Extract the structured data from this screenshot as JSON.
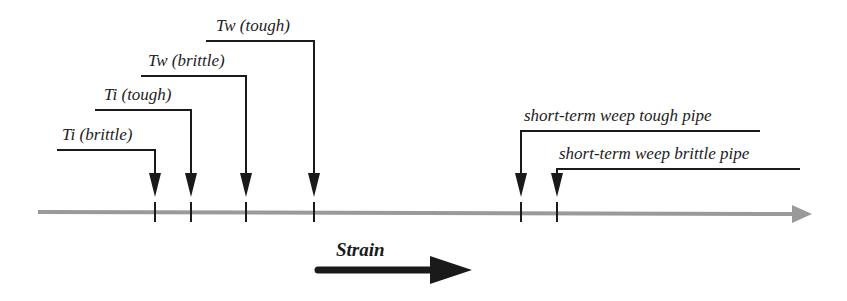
{
  "diagram": {
    "axis": {
      "label": "Strain",
      "color": "#9a9a9a"
    },
    "markers": [
      {
        "id": "ti-brittle",
        "label": "Ti (brittle)",
        "order": 1,
        "side": "left"
      },
      {
        "id": "ti-tough",
        "label": "Ti (tough)",
        "order": 2,
        "side": "left"
      },
      {
        "id": "tw-brittle",
        "label": "Tw (brittle)",
        "order": 3,
        "side": "left"
      },
      {
        "id": "tw-tough",
        "label": "Tw (tough)",
        "order": 4,
        "side": "left"
      },
      {
        "id": "weep-tough",
        "label": "short-term weep tough pipe",
        "order": 5,
        "side": "right"
      },
      {
        "id": "weep-brittle",
        "label": "short-term weep brittle pipe",
        "order": 6,
        "side": "right"
      }
    ],
    "line_color": "#1a1a1a"
  }
}
